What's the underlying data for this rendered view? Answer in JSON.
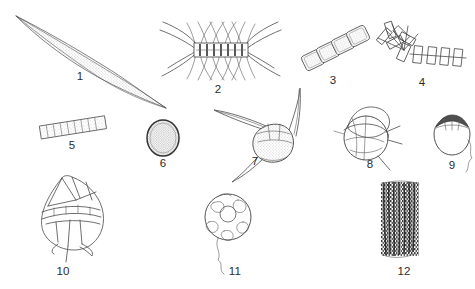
{
  "plate": {
    "title": "",
    "background_color": "#ffffff",
    "ink_color": "#4a4a4a",
    "label_color": "#2b2b2b",
    "width": 475,
    "height": 289,
    "specimen_count": 12
  },
  "specimens": [
    {
      "number": "1",
      "label": "1",
      "icon": "needle-diatom-icon",
      "form": "elongate needle-shaped cell with stippled interior and tapering points",
      "label_x": 80,
      "label_y": 77,
      "row": "top"
    },
    {
      "number": "2",
      "label": "2",
      "icon": "setae-chain-diatom-icon",
      "form": "chain colony of dark box cells with long crossing setae above and below",
      "label_x": 218,
      "label_y": 90,
      "row": "top"
    },
    {
      "number": "3",
      "label": "3",
      "icon": "rectangular-cell-chain-icon",
      "form": "diagonal chain of four rectangular stippled cells",
      "label_x": 333,
      "label_y": 81,
      "row": "top"
    },
    {
      "number": "4",
      "label": "4",
      "icon": "zigzag-rod-colony-icon",
      "form": "stellate zigzag colony of narrow rod-shaped cells",
      "label_x": 422,
      "label_y": 83,
      "row": "top"
    },
    {
      "number": "5",
      "label": "5",
      "icon": "segmented-filament-icon",
      "form": "short straight filament of about ten box-like segments",
      "label_x": 72,
      "label_y": 146,
      "row": "middle"
    },
    {
      "number": "6",
      "label": "6",
      "icon": "round-granular-cell-icon",
      "form": "rounded cell with dark outline and granular contents",
      "label_x": 163,
      "label_y": 164,
      "row": "middle"
    },
    {
      "number": "7",
      "label": "7",
      "icon": "three-horned-dinoflagellate-icon",
      "form": "dinoflagellate with long apical horn and two antapical horns, stippled body",
      "label_x": 255,
      "label_y": 162,
      "row": "middle"
    },
    {
      "number": "8",
      "label": "8",
      "icon": "armored-dinoflagellate-icon",
      "form": "rounded armoured dinoflagellate with thecal plates and short spines",
      "label_x": 370,
      "label_y": 165,
      "row": "middle"
    },
    {
      "number": "9",
      "label": "9",
      "icon": "capped-dinoflagellate-icon",
      "form": "small rounded cell with dark cap-like apical plate and trailing flagellum",
      "label_x": 452,
      "label_y": 166,
      "row": "middle"
    },
    {
      "number": "10",
      "label": "10",
      "icon": "angular-plated-dinoflagellate-icon",
      "form": "large angular dinoflagellate with faceted plates and antapical spines",
      "label_x": 63,
      "label_y": 272,
      "row": "bottom"
    },
    {
      "number": "11",
      "label": "11",
      "icon": "spherical-flagellate-icon",
      "form": "spherical cell with polygonal surface pattern and trailing flagellum",
      "label_x": 235,
      "label_y": 272,
      "row": "bottom"
    },
    {
      "number": "12",
      "label": "12",
      "icon": "filament-bundle-icon",
      "form": "dense bundle of dark parallel filaments",
      "label_x": 404,
      "label_y": 272,
      "row": "bottom"
    }
  ]
}
